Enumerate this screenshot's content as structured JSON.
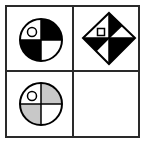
{
  "puzzle": {
    "grid": {
      "rows": 2,
      "cols": 2,
      "border_color": "#1a1a1a",
      "background": "#ffffff"
    },
    "colors": {
      "black": "#000000",
      "white": "#ffffff",
      "gray": "#c8c8c8",
      "stroke": "#000000"
    },
    "cells": [
      {
        "position": "top-left",
        "figure": "circle-quadrants",
        "quadrants": {
          "top_left": "white",
          "top_right": "black",
          "bottom_left": "black",
          "bottom_right": "white"
        },
        "marker": {
          "shape": "small-circle",
          "quadrant": "top_left"
        }
      },
      {
        "position": "top-right",
        "figure": "diamond-quadrants",
        "quadrants": {
          "top_left": "white",
          "top_right": "split: black (toward top vertex) / white (toward right vertex)",
          "bottom_left": "split: black (toward left vertex) / white (toward bottom vertex)",
          "bottom_right": "black"
        },
        "marker": {
          "shape": "small-square",
          "quadrant": "top_left"
        }
      },
      {
        "position": "bottom-left",
        "figure": "circle-quadrants",
        "quadrants": {
          "top_left": "white",
          "top_right": "gray",
          "bottom_left": "gray",
          "bottom_right": "white"
        },
        "marker": {
          "shape": "small-circle",
          "quadrant": "top_left"
        }
      },
      {
        "position": "bottom-right",
        "figure": "empty"
      }
    ]
  }
}
